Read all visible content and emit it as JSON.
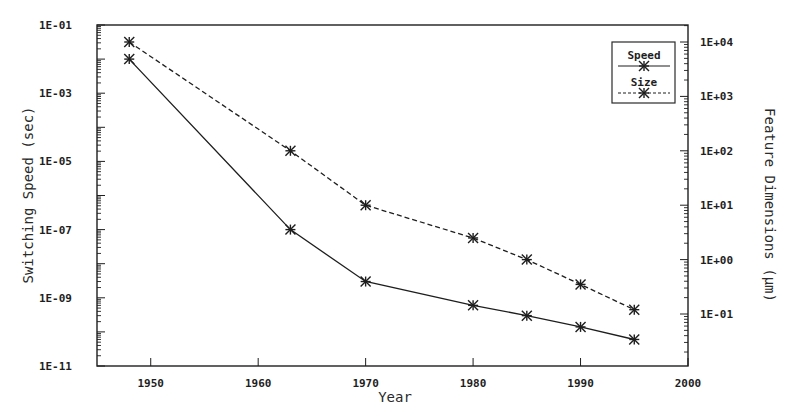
{
  "chart_data": {
    "type": "line",
    "title": "",
    "xlabel": "Year",
    "ylabel": "Switching Speed (sec)",
    "y2label": "Feature Dimensions (µm)",
    "xlim": [
      1945,
      2000
    ],
    "ylim": [
      1e-11,
      0.1
    ],
    "y2lim": [
      0.01,
      30000
    ],
    "x_ticks": [
      "1950",
      "1960",
      "1970",
      "1980",
      "1990",
      "2000"
    ],
    "y_ticks": [
      "1E-01",
      "1E-03",
      "1E-05",
      "1E-07",
      "1E-09",
      "1E-11"
    ],
    "y2_ticks": [
      "1E+04",
      "1E+03",
      "1E+02",
      "1E+01",
      "1E+00",
      "1E-01"
    ],
    "y_scale": "log",
    "y2_scale": "log",
    "grid": false,
    "legend_position": "upper right",
    "series": [
      {
        "name": "Speed",
        "axis": "left",
        "line_style": "solid",
        "marker": "asterisk",
        "x": [
          1948,
          1963,
          1970,
          1980,
          1985,
          1990,
          1995
        ],
        "values": [
          0.01,
          1e-07,
          3e-09,
          6e-10,
          3e-10,
          1.4e-10,
          6e-11
        ]
      },
      {
        "name": "Size",
        "axis": "right",
        "line_style": "dashed",
        "marker": "asterisk",
        "x": [
          1948,
          1963,
          1970,
          1980,
          1985,
          1990,
          1995
        ],
        "values": [
          10000,
          100,
          10,
          2.5,
          1.0,
          0.35,
          0.12
        ]
      }
    ]
  },
  "axes": {
    "x_title": "Year",
    "y_title": "Switching Speed (sec)",
    "y2_title": "Feature Dimensions (µm)"
  },
  "legend": {
    "items": [
      {
        "label": "Speed",
        "style": "solid"
      },
      {
        "label": "Size",
        "style": "dashed"
      }
    ]
  },
  "colors": {
    "ink": "#1e1e1e",
    "background": "#ffffff"
  }
}
